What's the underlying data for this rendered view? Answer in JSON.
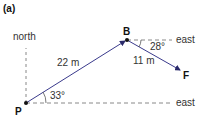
{
  "panel_label": "(a)",
  "labels": {
    "north": "north",
    "east_top": "east",
    "east_bottom": "east",
    "dist_PB": "22 m",
    "dist_BF": "11 m",
    "angle_P": "33°",
    "angle_B": "28°",
    "point_P": "P",
    "point_B": "B",
    "point_F": "F"
  },
  "colors": {
    "vector": "#3a3a8c",
    "dashed": "#888888",
    "text": "#333333"
  }
}
